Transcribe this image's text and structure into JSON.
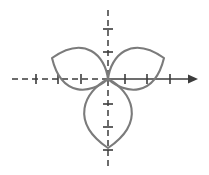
{
  "figure": {
    "title": "Three-petaled polar rose curve",
    "kind": "polar-rose-plot",
    "width": 209,
    "height": 175,
    "background_color": "#ffffff",
    "curve_color": "#7b7b7b",
    "axis_color": "#3c3c3c",
    "curve_stroke_width": 2.1,
    "axis_stroke_width": 1.5,
    "tick_stroke_width": 1.6
  },
  "origin": {
    "label": "origin",
    "x": 108,
    "y": 79
  },
  "x_axis": {
    "label": "horizontal-axis",
    "y": 79,
    "negative_start_x": 12,
    "negative_end_x": 108,
    "negative_style": "dashed",
    "dash_pattern": "6,4",
    "positive_start_x": 108,
    "positive_end_x": 190,
    "positive_style": "solid",
    "arrowhead": true,
    "arrowhead_tip_x": 198,
    "tick_half_length": 5,
    "negative_ticks": [
      36,
      58,
      81
    ],
    "positive_ticks": [
      125,
      147,
      170
    ]
  },
  "y_axis": {
    "label": "vertical-axis",
    "x": 108,
    "top_y": 10,
    "bottom_y": 170,
    "style": "dashed",
    "dash_pattern": "6,4",
    "arrowhead": false,
    "tick_half_length": 5,
    "ticks_above": [
      29,
      52
    ],
    "ticks_below": [
      104,
      127,
      150
    ]
  },
  "chart_data": {
    "type": "line",
    "subtype": "polar-rose",
    "title": "Three-petaled polar rose curve",
    "equation": "r = a cos(3θ)",
    "petal_count": 3,
    "petal_length_units": 3,
    "coordinate_system": "polar",
    "grid": false,
    "legend": null,
    "xlabel": "",
    "ylabel": "",
    "petals": [
      {
        "name": "upper-left-petal",
        "direction_degrees": 150,
        "tip_x": 52,
        "tip_y": 58,
        "description": "lobe sweeping up and to the left of the origin"
      },
      {
        "name": "upper-right-petal",
        "direction_degrees": 30,
        "tip_x": 164,
        "tip_y": 58,
        "description": "lobe sweeping up and to the right of the origin"
      },
      {
        "name": "lower-petal",
        "direction_degrees": 270,
        "tip_x": 108,
        "tip_y": 148,
        "description": "teardrop lobe hanging straight down from the origin"
      }
    ],
    "axis_ticks": {
      "x_negative_count": 3,
      "x_positive_count": 3,
      "y_above_count": 2,
      "y_below_count": 3
    },
    "xlim": [
      -4.3,
      4.0
    ],
    "ylim": [
      -4.0,
      3.0
    ]
  }
}
